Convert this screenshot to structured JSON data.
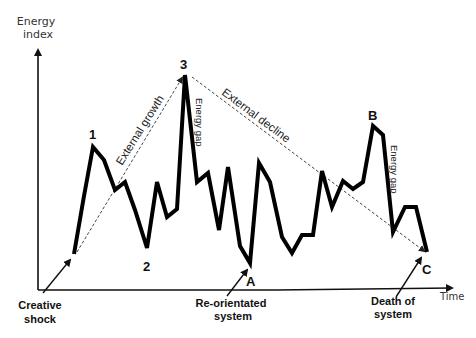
{
  "diagram": {
    "y_axis_label_line1": "Energy",
    "y_axis_label_line2": "index",
    "x_axis_label": "Time",
    "points": {
      "p1": "1",
      "p2": "2",
      "p3": "3",
      "A": "A",
      "B": "B",
      "C": "C"
    },
    "trend_labels": {
      "growth": "External growth",
      "decline": "External decline",
      "gap1": "Energy gap",
      "gap2": "Energy gap"
    },
    "annotations": {
      "creative_line1": "Creative",
      "creative_line2": "shock",
      "reoriented_line1": "Re-orientated",
      "reoriented_line2": "system",
      "death_line1": "Death of",
      "death_line2": "system"
    },
    "colors": {
      "line": "#000000",
      "axis": "#111111",
      "dashed": "#333333",
      "text": "#111111"
    }
  }
}
